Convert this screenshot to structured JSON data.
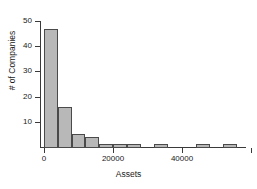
{
  "chart_data": {
    "type": "bar",
    "title": "",
    "subtitle": "",
    "xlabel": "Assets",
    "ylabel": "# of Companies",
    "xlim": [
      -2000,
      62000
    ],
    "ylim": [
      0,
      50
    ],
    "grid": false,
    "legend": null,
    "bin_width": 4000,
    "x_ticks": [
      {
        "value": 0,
        "label": "0"
      },
      {
        "value": 20000,
        "label": "20000"
      },
      {
        "value": 40000,
        "label": "40000"
      },
      {
        "value": 60000,
        "label": ""
      }
    ],
    "y_ticks": [
      {
        "value": 10,
        "label": "10"
      },
      {
        "value": 20,
        "label": "20"
      },
      {
        "value": 30,
        "label": "30"
      },
      {
        "value": 40,
        "label": "40"
      },
      {
        "value": 50,
        "label": "50"
      }
    ],
    "bins": [
      {
        "x0": 0,
        "x1": 4000,
        "value": 47
      },
      {
        "x0": 4000,
        "x1": 8000,
        "value": 16
      },
      {
        "x0": 8000,
        "x1": 12000,
        "value": 5
      },
      {
        "x0": 12000,
        "x1": 16000,
        "value": 4
      },
      {
        "x0": 16000,
        "x1": 20000,
        "value": 1
      },
      {
        "x0": 20000,
        "x1": 24000,
        "value": 1
      },
      {
        "x0": 24000,
        "x1": 28000,
        "value": 1
      },
      {
        "x0": 28000,
        "x1": 32000,
        "value": 0
      },
      {
        "x0": 32000,
        "x1": 36000,
        "value": 1
      },
      {
        "x0": 36000,
        "x1": 40000,
        "value": 0
      },
      {
        "x0": 40000,
        "x1": 44000,
        "value": 0
      },
      {
        "x0": 44000,
        "x1": 48000,
        "value": 1
      },
      {
        "x0": 48000,
        "x1": 52000,
        "value": 0
      },
      {
        "x0": 52000,
        "x1": 56000,
        "value": 1
      }
    ],
    "categories": [
      "0-4000",
      "4000-8000",
      "8000-12000",
      "12000-16000",
      "16000-20000",
      "20000-24000",
      "24000-28000",
      "28000-32000",
      "32000-36000",
      "36000-40000",
      "40000-44000",
      "44000-48000",
      "48000-52000",
      "52000-56000"
    ],
    "values": [
      47,
      16,
      5,
      4,
      1,
      1,
      1,
      0,
      1,
      0,
      0,
      1,
      0,
      1
    ],
    "colors": {
      "bar_fill": "#b8b8b8",
      "bar_stroke": "#4a4a4a",
      "axis": "#3a3a3a",
      "text": "#1a1a1a",
      "background": "#ffffff"
    }
  }
}
